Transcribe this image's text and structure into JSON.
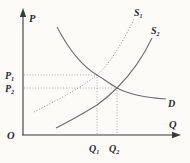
{
  "colors": {
    "background": "#fcfbf8",
    "axis": "#3b3b3b",
    "curve": "#6e6e6e",
    "guide": "#8c8c8c",
    "text": "#2b2b2b"
  },
  "axes": {
    "y_label": "P",
    "x_label": "Q",
    "origin_label": "O"
  },
  "curves": {
    "s1": {
      "base": "S",
      "sub": "1"
    },
    "s2": {
      "base": "S",
      "sub": "2"
    },
    "d": {
      "base": "D",
      "sub": ""
    }
  },
  "price_ticks": {
    "p1": {
      "base": "P",
      "sub": "1"
    },
    "p2": {
      "base": "P",
      "sub": "2"
    }
  },
  "quantity_ticks": {
    "q1": {
      "base": "Q",
      "sub": "1"
    },
    "q2": {
      "base": "Q",
      "sub": "2"
    }
  }
}
